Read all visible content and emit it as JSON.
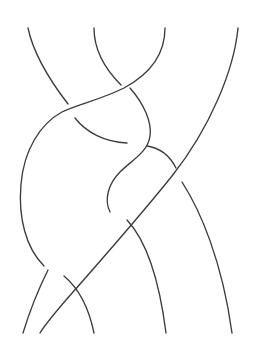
{
  "figure": {
    "kind": "line-drawing",
    "background_color": "#ffffff",
    "stroke_color": "#3c3c3c",
    "stroke_width": 1.35,
    "canvas": {
      "width": 254,
      "height": 341
    },
    "strand_count": 4,
    "top_endpoints_x": [
      28,
      94,
      165,
      239
    ],
    "top_endpoints_y": 28,
    "bottom_endpoints_x": [
      22,
      95,
      168,
      233
    ],
    "bottom_endpoints_y": 333,
    "crossings": [
      {
        "id": "c1",
        "x": 125,
        "y": 88,
        "over": "descending-right-to-left",
        "under": "strand-2"
      },
      {
        "id": "c2",
        "x": 70,
        "y": 107,
        "over": "long-diagonal",
        "under": "strand-1"
      },
      {
        "id": "c3",
        "x": 130,
        "y": 140,
        "over": "s-curve",
        "under": "inner-arc"
      },
      {
        "id": "c4",
        "x": 141,
        "y": 167,
        "over": "s-curve",
        "under": "short-arc"
      },
      {
        "id": "c5",
        "x": 185,
        "y": 176,
        "over": "long-diagonal",
        "under": "right-strand"
      },
      {
        "id": "c6",
        "x": 57,
        "y": 272,
        "over": "rising-diagonal",
        "under": "left-bulge-strand"
      }
    ],
    "arcs": [
      {
        "name": "strand-1-upper-left",
        "d": "M 28 28 C 33 52 48 78 68 104"
      },
      {
        "name": "long-diagonal-over",
        "d": "M 238 28 C 234 70 210 128 172 176 C 140 216 96 266 66 300 C 54 314 44 326 40 333"
      },
      {
        "name": "strand-2-upper",
        "d": "M 94 28 C 94 48 104 68 121 85"
      },
      {
        "name": "big-left-arc",
        "d": "M 165 28 C 165 54 150 74 124 88 C 100 100 78 104 62 112 C 40 124 24 150 21 184 C 18 218 26 248 44 266"
      },
      {
        "name": "inner-upper-arc",
        "d": "M 75 118 C 86 132 104 142 127 143"
      },
      {
        "name": "s-curve-main",
        "d": "M 130 88 C 144 104 152 122 150 136 C 148 152 132 160 120 172 C 108 184 104 200 110 212"
      },
      {
        "name": "short-arc-right-of-s",
        "d": "M 147 146 C 160 148 170 156 176 168"
      },
      {
        "name": "left-bulge-down",
        "d": "M 48 270 C 40 286 30 310 23 333"
      },
      {
        "name": "rising-diagonal-lower",
        "d": "M 64 276 C 76 286 88 304 94 333"
      },
      {
        "name": "right-inner-down",
        "d": "M 127 220 C 142 236 158 270 166 333"
      },
      {
        "name": "right-outer-down",
        "d": "M 182 182 C 200 210 222 260 232 333"
      }
    ]
  }
}
